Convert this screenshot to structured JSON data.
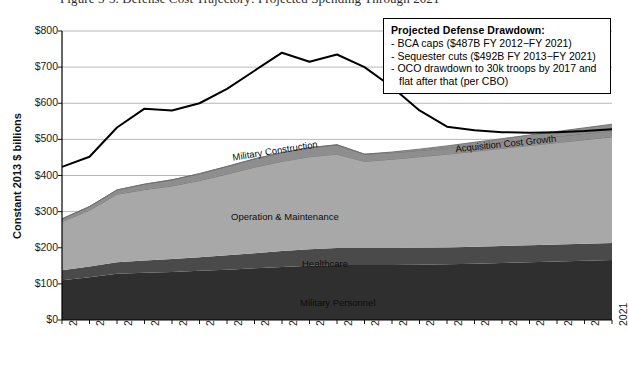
{
  "figure": {
    "caption": "Figure 5-3. Defense Cost Trajectory: Projected Spending Through 2021"
  },
  "callout": {
    "title": "Projected Defense Drawdown:",
    "items": [
      "- BCA caps ($487B FY 2012−FY 2021)",
      "- Sequester cuts ($492B FY 2013−FY 2021)",
      "- OCO drawdown to 30k troops by 2017 and"
    ],
    "continuation": "flat after that (per CBO)"
  },
  "colors": {
    "military_personnel": "#2f2f2f",
    "healthcare": "#4a4a4a",
    "operation_maintenance": "#a8a8a8",
    "military_construction": "#8e8e8e",
    "acquisition_cost_growth": "#8e8e8e",
    "total_line": "#000000",
    "gridline": "#9a9a9a",
    "axis": "#000000",
    "background": "#ffffff"
  },
  "chart_data": {
    "type": "area",
    "title": "",
    "xlabel": "",
    "ylabel": "Constant 2013 $ billions",
    "ylim": [
      0,
      800
    ],
    "yticks": [
      0,
      100,
      200,
      300,
      400,
      500,
      600,
      700,
      800
    ],
    "ytick_labels": [
      "$0",
      "$100",
      "$200",
      "$300",
      "$400",
      "$500",
      "$600",
      "$700",
      "$800"
    ],
    "grid": true,
    "legend_position": "inline-labels",
    "categories": [
      "2001",
      "2002",
      "2003",
      "2004",
      "2005",
      "2006",
      "2007",
      "2008",
      "2009",
      "2010",
      "2011",
      "2012",
      "2013",
      "2014",
      "2015",
      "2016",
      "2017",
      "2018",
      "2019",
      "2020",
      "2021"
    ],
    "stacked": true,
    "series": [
      {
        "name": "Military Personnel",
        "values": [
          110,
          118,
          128,
          131,
          133,
          136,
          139,
          143,
          147,
          150,
          152,
          152,
          152,
          153,
          154,
          156,
          158,
          160,
          162,
          164,
          166
        ]
      },
      {
        "name": "Healthcare",
        "values": [
          28,
          30,
          32,
          34,
          36,
          38,
          40,
          42,
          44,
          46,
          47,
          47,
          47,
          47,
          47,
          47,
          47,
          47,
          47,
          47,
          47
        ]
      },
      {
        "name": "Operation & Maintenance",
        "values": [
          134,
          156,
          188,
          196,
          202,
          212,
          225,
          238,
          248,
          256,
          260,
          240,
          246,
          252,
          258,
          264,
          270,
          276,
          282,
          288,
          294
        ]
      },
      {
        "name": "Military Construction",
        "values": [
          8,
          10,
          12,
          15,
          17,
          19,
          21,
          23,
          24,
          25,
          26,
          20,
          18,
          17,
          17,
          17,
          17,
          17,
          17,
          17,
          17
        ]
      },
      {
        "name": "Acquisition Cost Growth",
        "values": [
          0,
          0,
          0,
          0,
          0,
          0,
          0,
          0,
          0,
          0,
          0,
          0,
          2,
          4,
          6,
          8,
          10,
          12,
          14,
          16,
          18
        ]
      }
    ],
    "overlay_line": {
      "name": "Total Defense Budget (with war costs)",
      "values": [
        424,
        452,
        533,
        585,
        580,
        600,
        640,
        690,
        740,
        715,
        735,
        700,
        645,
        580,
        535,
        525,
        520,
        518,
        520,
        523,
        528
      ]
    }
  }
}
